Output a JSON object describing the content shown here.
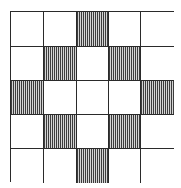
{
  "diagram": {
    "type": "grid-pattern",
    "rows": 5,
    "cols": 5,
    "cell_fill_styles": {
      "0": "blank",
      "1": "vertical-hatch"
    },
    "pattern": [
      [
        0,
        0,
        1,
        0,
        0
      ],
      [
        0,
        1,
        0,
        1,
        0
      ],
      [
        1,
        0,
        0,
        0,
        1
      ],
      [
        0,
        1,
        0,
        1,
        0
      ],
      [
        0,
        0,
        1,
        0,
        0
      ]
    ],
    "colors": {
      "grid_line": "#2a2a2a",
      "hatch_dark": "#3c3c3c",
      "hatch_light": "#d4d4d4",
      "background": "#ffffff"
    }
  }
}
